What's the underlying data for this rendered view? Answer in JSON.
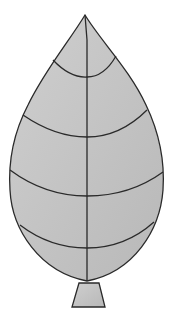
{
  "diagram": {
    "type": "leaf-outline",
    "colors": {
      "fill": "#c4c4c4",
      "stroke": "#2a2a2a",
      "background": "#ffffff"
    },
    "parts": [
      "blade",
      "midrib",
      "lateral-veins",
      "stem"
    ],
    "lateral_vein_count": 4
  }
}
